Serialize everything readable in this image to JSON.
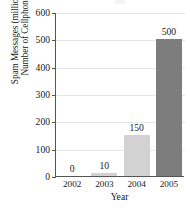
{
  "chart_data": {
    "type": "bar",
    "title": "",
    "subtitle": "",
    "xlabel": "Year",
    "ylabel_lines": [
      "Number of Cellphone",
      "Spam Messages (millions)"
    ],
    "ylabel": "Number of Cellphone Spam Messages (millions)",
    "categories": [
      "2002",
      "2003",
      "2004",
      "2005"
    ],
    "values": [
      0,
      10,
      150,
      500
    ],
    "value_labels": [
      "0",
      "10",
      "150",
      "500"
    ],
    "bar_colors": [
      "#d2d2d2",
      "#d2d2d2",
      "#d2d2d2",
      "#7d7d7d"
    ],
    "ylim": [
      0,
      600
    ],
    "yticks": [
      0,
      100,
      200,
      300,
      400,
      500,
      600
    ],
    "ytick_labels": [
      "0",
      "100",
      "200",
      "300",
      "400",
      "500",
      "600"
    ],
    "grid": true,
    "grid_color": "#e6e6e6",
    "legend": null,
    "axis_color": "#555555"
  }
}
